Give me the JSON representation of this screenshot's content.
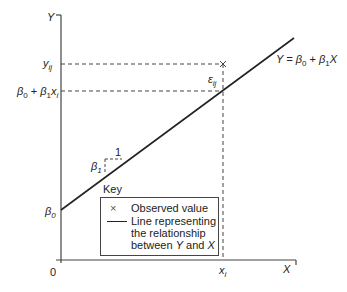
{
  "diagram": {
    "type": "linear regression model illustration",
    "axes": {
      "y_label": "Y",
      "x_label": "X",
      "origin_label": "0"
    },
    "y_ticks": {
      "y_ij": {
        "base": "y",
        "sub": "ij"
      },
      "fitted": {
        "b0": "β",
        "b0_sub": "0",
        "plus": " + ",
        "b1": "β",
        "b1_sub": "1",
        "x": "x",
        "x_sub": "i"
      },
      "intercept": {
        "base": "β",
        "sub": "0"
      }
    },
    "x_ticks": {
      "x_i": {
        "base": "x",
        "sub": "i"
      }
    },
    "equation": {
      "lhs": "Y = ",
      "b0": "β",
      "b0_sub": "0",
      "plus": " + ",
      "b1": "β",
      "b1_sub": "1",
      "x": "X"
    },
    "error_label": {
      "base": "ε",
      "sub": "ij"
    },
    "slope": {
      "run_label": "1",
      "rise_label": "β",
      "rise_sub": "1"
    },
    "key": {
      "title": "Key",
      "items": [
        {
          "symbol": "×",
          "label": "Observed value"
        },
        {
          "symbol": "line",
          "label_lines": [
            "Line representing",
            "the relationship",
            "between "
          ],
          "y": "Y",
          "and": " and ",
          "x": "X"
        }
      ]
    },
    "colors": {
      "line": "#222222",
      "axis": "#444444",
      "dashed": "#444444",
      "background": "#ffffff"
    }
  }
}
